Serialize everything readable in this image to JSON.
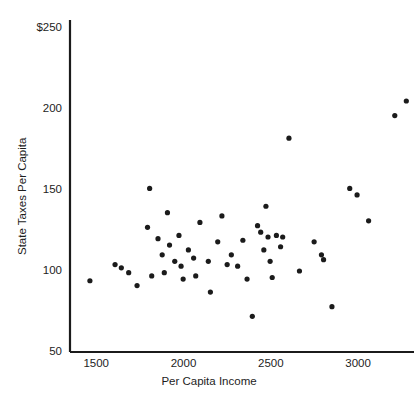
{
  "chart_data": {
    "type": "scatter",
    "title": "",
    "xlabel": "Per Capita Income",
    "ylabel": "State Taxes Per Capita",
    "xlim": [
      1350,
      3320
    ],
    "ylim": [
      50,
      255
    ],
    "grid": false,
    "legend": null,
    "xticks": [
      1500,
      2000,
      2500,
      3000
    ],
    "xtick_labels": [
      "1500",
      "2000",
      "2500",
      "3000"
    ],
    "yticks": [
      50,
      100,
      150,
      200,
      250
    ],
    "ytick_labels": [
      "50",
      "100",
      "150",
      "200",
      "$250"
    ],
    "marker": "filled-circle",
    "marker_color": "#1b1b1b",
    "axis_color": "#1b1b1b",
    "points": [
      {
        "x": 1464,
        "y": 94
      },
      {
        "x": 1608,
        "y": 104
      },
      {
        "x": 1644,
        "y": 102
      },
      {
        "x": 1686,
        "y": 99
      },
      {
        "x": 1734,
        "y": 91
      },
      {
        "x": 1794,
        "y": 127
      },
      {
        "x": 1806,
        "y": 151
      },
      {
        "x": 1818,
        "y": 97
      },
      {
        "x": 1854,
        "y": 120
      },
      {
        "x": 1878,
        "y": 110
      },
      {
        "x": 1890,
        "y": 99
      },
      {
        "x": 1908,
        "y": 136
      },
      {
        "x": 1920,
        "y": 116
      },
      {
        "x": 1950,
        "y": 106
      },
      {
        "x": 1974,
        "y": 122
      },
      {
        "x": 1986,
        "y": 103
      },
      {
        "x": 1998,
        "y": 95
      },
      {
        "x": 2028,
        "y": 113
      },
      {
        "x": 2058,
        "y": 108
      },
      {
        "x": 2070,
        "y": 97
      },
      {
        "x": 2094,
        "y": 130
      },
      {
        "x": 2142,
        "y": 106
      },
      {
        "x": 2154,
        "y": 87
      },
      {
        "x": 2196,
        "y": 118
      },
      {
        "x": 2220,
        "y": 134
      },
      {
        "x": 2250,
        "y": 104
      },
      {
        "x": 2274,
        "y": 110
      },
      {
        "x": 2310,
        "y": 103
      },
      {
        "x": 2340,
        "y": 119
      },
      {
        "x": 2364,
        "y": 95
      },
      {
        "x": 2394,
        "y": 72
      },
      {
        "x": 2424,
        "y": 128
      },
      {
        "x": 2442,
        "y": 124
      },
      {
        "x": 2460,
        "y": 113
      },
      {
        "x": 2472,
        "y": 140
      },
      {
        "x": 2484,
        "y": 121
      },
      {
        "x": 2496,
        "y": 106
      },
      {
        "x": 2508,
        "y": 96
      },
      {
        "x": 2532,
        "y": 122
      },
      {
        "x": 2556,
        "y": 115
      },
      {
        "x": 2568,
        "y": 121
      },
      {
        "x": 2604,
        "y": 182
      },
      {
        "x": 2664,
        "y": 100
      },
      {
        "x": 2748,
        "y": 118
      },
      {
        "x": 2790,
        "y": 110
      },
      {
        "x": 2802,
        "y": 107
      },
      {
        "x": 2850,
        "y": 78
      },
      {
        "x": 2952,
        "y": 151
      },
      {
        "x": 2994,
        "y": 147
      },
      {
        "x": 3060,
        "y": 131
      },
      {
        "x": 3210,
        "y": 196
      },
      {
        "x": 3276,
        "y": 205
      }
    ]
  }
}
